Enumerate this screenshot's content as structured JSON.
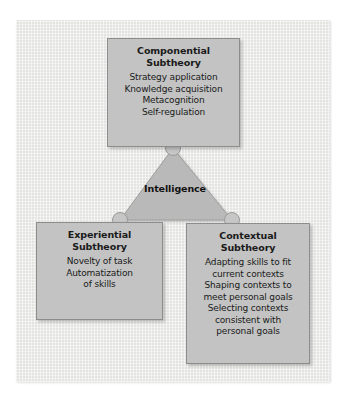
{
  "figure": {
    "center_label": "Intelligence",
    "colors": {
      "panel_background": "#e9e9e7",
      "box_fill": "#c3c3c3",
      "box_border": "#8d8d8d",
      "triangle_fill": "#b6b6b6",
      "text": "#1a1a1a"
    }
  },
  "boxes": {
    "componential": {
      "title_line1": "Componential",
      "title_line2": "Subtheory",
      "items": [
        "Strategy application",
        "Knowledge acquisition",
        "Metacognition",
        "Self-regulation"
      ]
    },
    "experiential": {
      "title_line1": "Experiential",
      "title_line2": "Subtheory",
      "items": [
        "Novelty of task",
        "Automatization",
        "of skills"
      ]
    },
    "contextual": {
      "title_line1": "Contextual",
      "title_line2": "Subtheory",
      "items": [
        "Adapting skills to fit",
        "current contexts",
        "Shaping contexts to",
        "meet personal goals",
        "Selecting contexts",
        "consistent with",
        "personal goals"
      ]
    }
  },
  "connectors": {
    "nodes": [
      {
        "name": "top-vertex-node",
        "cx": 173,
        "cy": 148
      },
      {
        "name": "bottom-left-vertex-node",
        "cx": 120,
        "cy": 220
      },
      {
        "name": "bottom-right-vertex-node",
        "cx": 232,
        "cy": 220
      }
    ]
  }
}
